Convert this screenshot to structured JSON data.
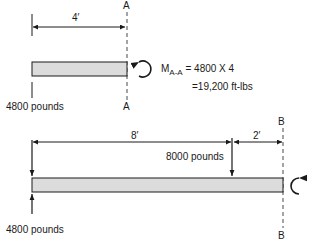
{
  "diagram1": {
    "dimension": "4′",
    "section_label_top": "A",
    "section_label_bottom": "A",
    "reaction_label": "4800 pounds",
    "moment": {
      "symbol": "M",
      "subscript": "A-A",
      "equation": "= 4800 X 4",
      "result": "=19,200 ft-lbs"
    }
  },
  "diagram2": {
    "dimension_left": "8′",
    "dimension_right": "2′",
    "section_label_top": "B",
    "section_label_bottom": "B",
    "point_load_label": "8000 pounds",
    "reaction_label": "4800 pounds"
  },
  "colors": {
    "beam_fill": "#dcdcdc",
    "line": "#1a1a1a"
  }
}
